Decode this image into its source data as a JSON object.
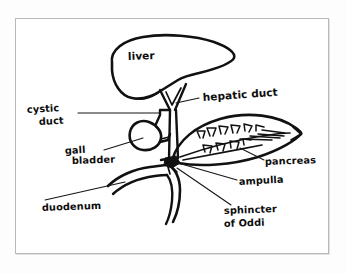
{
  "figure": {
    "type": "anatomical-diagram",
    "style": "hand-drawn line drawing",
    "background_color": "#ffffff",
    "ink_color": "#111111",
    "frame_color": "#b9b9b9"
  },
  "labels": {
    "liver": "liver",
    "hepatic_duct": "hepatic duct",
    "cystic_duct_line1": "cystic",
    "cystic_duct_line2": "duct",
    "gall_bladder_line1": "gall",
    "gall_bladder_line2": "bladder",
    "pancreas": "pancreas",
    "ampulla": "ampulla",
    "sphincter_line1": "sphincter",
    "sphincter_line2": "of Oddi",
    "duodenum": "duodenum"
  },
  "structures": [
    {
      "name": "liver",
      "label": "liver",
      "label_placement": "inside"
    },
    {
      "name": "hepatic-duct",
      "label": "hepatic duct",
      "label_placement": "right"
    },
    {
      "name": "cystic-duct",
      "label": "cystic duct",
      "label_placement": "left"
    },
    {
      "name": "gall-bladder",
      "label": "gall bladder",
      "label_placement": "left"
    },
    {
      "name": "pancreas",
      "label": "pancreas",
      "label_placement": "right"
    },
    {
      "name": "ampulla",
      "label": "ampulla",
      "label_placement": "right"
    },
    {
      "name": "sphincter-of-oddi",
      "label": "sphincter of Oddi",
      "label_placement": "bottom-right"
    },
    {
      "name": "duodenum",
      "label": "duodenum",
      "label_placement": "bottom-left"
    }
  ]
}
